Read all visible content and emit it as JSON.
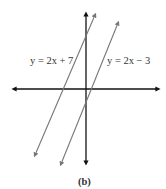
{
  "figure": {
    "caption": "(b)",
    "axes": {
      "x_axis": {
        "arrows": "both",
        "color": "#111111"
      },
      "y_axis": {
        "arrows": "both",
        "color": "#111111"
      }
    },
    "lines": [
      {
        "id": "line-1",
        "equation": "y = 2x + 7",
        "color": "#777777",
        "arrows": "both"
      },
      {
        "id": "line-2",
        "equation": "y = 2x − 3",
        "color": "#777777",
        "arrows": "both"
      }
    ]
  }
}
